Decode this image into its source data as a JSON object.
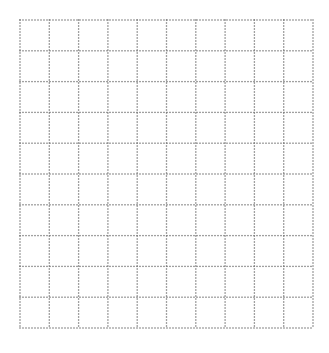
{
  "grid": {
    "columns": 10,
    "rows": 10,
    "left": 20,
    "top": 20,
    "right": 313,
    "bottom": 328,
    "dot_spacing": 3,
    "dot_size": 1.3,
    "dot_color": "#6f6f6f",
    "background": "#ffffff"
  }
}
